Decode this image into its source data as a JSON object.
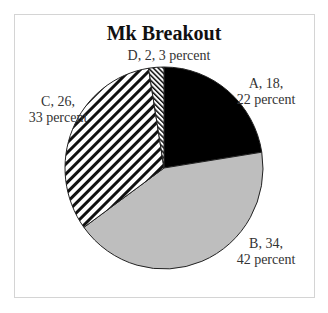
{
  "chart_data": {
    "type": "pie",
    "title": "Mk Breakout",
    "categories": [
      "A",
      "B",
      "C",
      "D"
    ],
    "values": [
      18,
      34,
      26,
      2
    ],
    "percents": [
      22,
      42,
      33,
      3
    ],
    "series": [
      {
        "name": "Mk",
        "values": [
          18,
          34,
          26,
          2
        ]
      }
    ],
    "labels": [
      {
        "line1": "A, 18,",
        "line2": "22 percent"
      },
      {
        "line1": "B, 34,",
        "line2": "42 percent"
      },
      {
        "line1": "C, 26,",
        "line2": "33 percent"
      },
      {
        "line1": "D, 2, 3 percent",
        "line2": ""
      }
    ],
    "fills": {
      "A": "#000000",
      "B": "#bdbdbd",
      "C": "diagonal-hatch",
      "D": "dense-diagonal-hatch"
    },
    "legend": "none"
  }
}
